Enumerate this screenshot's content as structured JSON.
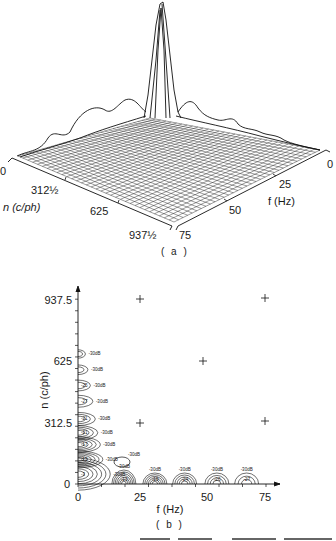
{
  "chart_data": [
    {
      "panel": "(a)",
      "type": "surface",
      "title": "",
      "xlabel": "n (c/ph)",
      "ylabel": "f (Hz)",
      "n_ticks": [
        "0",
        "312½",
        "625",
        "937½"
      ],
      "f_ticks": [
        "0",
        "25",
        "50",
        "75"
      ],
      "description": "3D wireframe power spectrum; dominant peak at n=0, f=0; smaller ridges along n-axis and f-axis decreasing with distance",
      "peaks": [
        {
          "n": 0,
          "f": 0,
          "relative_height": 1.0
        },
        {
          "n": 0,
          "f": 12.5,
          "relative_height": 0.22
        },
        {
          "n": 0,
          "f": 25,
          "relative_height": 0.12
        },
        {
          "n": 0,
          "f": 37.5,
          "relative_height": 0.09
        },
        {
          "n": 0,
          "f": 50,
          "relative_height": 0.07
        },
        {
          "n": 0,
          "f": 62.5,
          "relative_height": 0.05
        },
        {
          "n": 125,
          "f": 0,
          "relative_height": 0.24
        },
        {
          "n": 250,
          "f": 0,
          "relative_height": 0.17
        },
        {
          "n": 375,
          "f": 0,
          "relative_height": 0.12
        },
        {
          "n": 500,
          "f": 0,
          "relative_height": 0.08
        }
      ]
    },
    {
      "panel": "(b)",
      "type": "contour",
      "title": "",
      "xlabel": "f (Hz)",
      "ylabel": "n (c/ph)",
      "x_ticks": [
        "0",
        "25",
        "50",
        "75"
      ],
      "y_ticks": [
        "0",
        "312.5",
        "625",
        "937.5"
      ],
      "xlim": [
        0,
        80
      ],
      "ylim": [
        0,
        1000
      ],
      "plus_markers": [
        {
          "f": 25,
          "n": 937.5
        },
        {
          "f": 75,
          "n": 937.5
        },
        {
          "f": 50,
          "n": 625
        },
        {
          "f": 25,
          "n": 312.5
        },
        {
          "f": 75,
          "n": 312.5
        }
      ],
      "contour_outer_level": "-30dB",
      "n_axis_lobes": [
        {
          "n_center": 50,
          "f_extent": 13,
          "inner_label": "-3"
        },
        {
          "n_center": 125,
          "f_extent": 10,
          "inner_label": "-12"
        },
        {
          "n_center": 200,
          "f_extent": 9,
          "inner_label": "-17"
        },
        {
          "n_center": 260,
          "f_extent": 8,
          "inner_label": "-21"
        },
        {
          "n_center": 330,
          "f_extent": 7,
          "inner_label": "-21"
        },
        {
          "n_center": 420,
          "f_extent": 6,
          "inner_label": "-27"
        },
        {
          "n_center": 500,
          "f_extent": 5,
          "inner_label": "-25"
        },
        {
          "n_center": 580,
          "f_extent": 4,
          "inner_label": ""
        },
        {
          "n_center": 660,
          "f_extent": 3,
          "inner_label": ""
        }
      ],
      "f_axis_lobes": [
        {
          "f_center": 18.5,
          "inner_label": "-13"
        },
        {
          "f_center": 31,
          "inner_label": "-19"
        },
        {
          "f_center": 43,
          "inner_label": "-24"
        },
        {
          "f_center": 56,
          "inner_label": "-26"
        },
        {
          "f_center": 68,
          "inner_label": "-27"
        }
      ],
      "isolated_contour": {
        "f": 18.5,
        "n": 120,
        "label": "-30dB"
      }
    }
  ],
  "panel_a": {
    "caption": "( a )",
    "n_label": "n (c/ph)",
    "f_label": "f (Hz)",
    "n_ticks": [
      "0",
      "312½",
      "625",
      "937½"
    ],
    "f_ticks": [
      "0",
      "25",
      "50",
      "75"
    ]
  },
  "panel_b": {
    "caption": "( b )",
    "xlabel": "f (Hz)",
    "ylabel": "n (c/ph)",
    "x_ticks": [
      "0",
      "25",
      "50",
      "75"
    ],
    "y_ticks": [
      "0",
      "312.5",
      "625",
      "937.5"
    ],
    "level_label": "-30dB",
    "inner_labels": [
      "-3",
      "-12",
      "-17",
      "-21",
      "-21",
      "-27",
      "-25",
      "-13",
      "-19",
      "-24",
      "-26",
      "-27"
    ]
  }
}
